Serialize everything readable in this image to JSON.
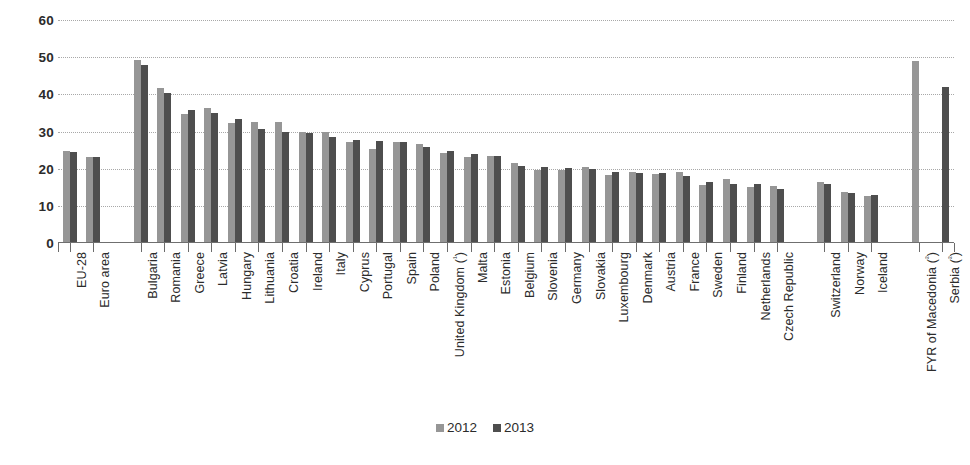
{
  "chart_data": {
    "type": "bar",
    "title": "",
    "subtitle": "",
    "xlabel": "",
    "ylabel": "",
    "ylim": [
      0,
      60
    ],
    "yticks": [
      0,
      10,
      20,
      30,
      40,
      50,
      60
    ],
    "grid": true,
    "legend_position": "bottom",
    "categories": [
      "EU-28",
      "Euro area",
      "Bulgaria",
      "Romania",
      "Greece",
      "Latvia",
      "Hungary",
      "Lithuania",
      "Croatia",
      "Ireland",
      "Italy",
      "Cyprus",
      "Portugal",
      "Spain",
      "Poland",
      "United Kingdom (¹)",
      "Malta",
      "Estonia",
      "Belgium",
      "Slovenia",
      "Germany",
      "Slovakia",
      "Luxembourg",
      "Denmark",
      "Austria",
      "France",
      "Sweden",
      "Finland",
      "Netherlands",
      "Czech Republic",
      "Switzerland",
      "Norway",
      "Iceland",
      "FYR of Macedonia (²)",
      "Serbia (²)"
    ],
    "series": [
      {
        "name": "2012",
        "color": "#969696",
        "values": [
          24.8,
          23.2,
          49.3,
          41.7,
          34.6,
          36.2,
          32.4,
          32.5,
          32.6,
          30.0,
          29.9,
          27.1,
          25.3,
          27.2,
          26.7,
          24.1,
          23.1,
          23.4,
          21.6,
          19.6,
          19.6,
          20.5,
          18.4,
          19.0,
          18.5,
          19.1,
          15.6,
          17.2,
          15.0,
          15.4,
          16.3,
          13.8,
          12.7,
          48.9,
          null
        ]
      },
      {
        "name": "2013",
        "color": "#4e4e4e",
        "values": [
          24.5,
          23.1,
          48.0,
          40.4,
          35.7,
          35.1,
          33.5,
          30.8,
          29.9,
          29.5,
          28.4,
          27.8,
          27.5,
          27.3,
          25.8,
          24.8,
          24.0,
          23.5,
          20.8,
          20.4,
          20.3,
          19.8,
          19.0,
          18.9,
          18.8,
          18.1,
          16.4,
          16.0,
          15.9,
          14.6,
          15.9,
          13.4,
          13.0,
          null,
          42.0
        ]
      }
    ],
    "group_breaks": [
      2,
      30,
      33
    ],
    "legend": [
      "2012",
      "2013"
    ]
  }
}
